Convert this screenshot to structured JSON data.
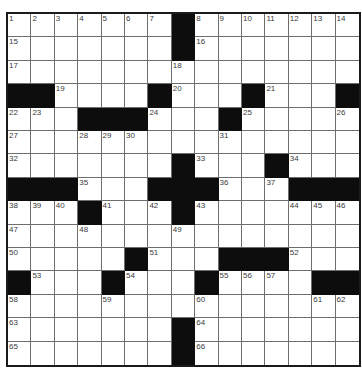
{
  "puzzle": {
    "size": 15,
    "colors": {
      "black_square": "#0d0d0d",
      "grid_line": "#6e6e6e",
      "border": "#1a1a1a"
    },
    "grid": [
      ".......#.......",
      ".......#.......",
      "...............",
      "##....#...#...#",
      "...###...#.....",
      "...............",
      ".......#...#...",
      "###...###...###",
      "...#...#.......",
      "...............",
      ".....#...###...",
      "#...#...#....##",
      "...............",
      ".......#.......",
      ".......#......."
    ],
    "numbers": [
      {
        "r": 0,
        "c": 0,
        "n": "1"
      },
      {
        "r": 0,
        "c": 1,
        "n": "2"
      },
      {
        "r": 0,
        "c": 2,
        "n": "3"
      },
      {
        "r": 0,
        "c": 3,
        "n": "4"
      },
      {
        "r": 0,
        "c": 4,
        "n": "5"
      },
      {
        "r": 0,
        "c": 5,
        "n": "6"
      },
      {
        "r": 0,
        "c": 6,
        "n": "7"
      },
      {
        "r": 0,
        "c": 8,
        "n": "8"
      },
      {
        "r": 0,
        "c": 9,
        "n": "9"
      },
      {
        "r": 0,
        "c": 10,
        "n": "10"
      },
      {
        "r": 0,
        "c": 11,
        "n": "11"
      },
      {
        "r": 0,
        "c": 12,
        "n": "12"
      },
      {
        "r": 0,
        "c": 13,
        "n": "13"
      },
      {
        "r": 0,
        "c": 14,
        "n": "14"
      },
      {
        "r": 1,
        "c": 0,
        "n": "15"
      },
      {
        "r": 1,
        "c": 8,
        "n": "16"
      },
      {
        "r": 2,
        "c": 0,
        "n": "17"
      },
      {
        "r": 2,
        "c": 7,
        "n": "18"
      },
      {
        "r": 3,
        "c": 2,
        "n": "19"
      },
      {
        "r": 3,
        "c": 7,
        "n": "20"
      },
      {
        "r": 3,
        "c": 11,
        "n": "21"
      },
      {
        "r": 4,
        "c": 0,
        "n": "22"
      },
      {
        "r": 4,
        "c": 1,
        "n": "23"
      },
      {
        "r": 4,
        "c": 6,
        "n": "24"
      },
      {
        "r": 4,
        "c": 10,
        "n": "25"
      },
      {
        "r": 4,
        "c": 14,
        "n": "26"
      },
      {
        "r": 5,
        "c": 0,
        "n": "27"
      },
      {
        "r": 5,
        "c": 3,
        "n": "28"
      },
      {
        "r": 5,
        "c": 4,
        "n": "29"
      },
      {
        "r": 5,
        "c": 5,
        "n": "30"
      },
      {
        "r": 5,
        "c": 9,
        "n": "31"
      },
      {
        "r": 6,
        "c": 0,
        "n": "32"
      },
      {
        "r": 6,
        "c": 8,
        "n": "33"
      },
      {
        "r": 6,
        "c": 12,
        "n": "34"
      },
      {
        "r": 7,
        "c": 3,
        "n": "35"
      },
      {
        "r": 7,
        "c": 9,
        "n": "36"
      },
      {
        "r": 7,
        "c": 11,
        "n": "37"
      },
      {
        "r": 8,
        "c": 0,
        "n": "38"
      },
      {
        "r": 8,
        "c": 1,
        "n": "39"
      },
      {
        "r": 8,
        "c": 2,
        "n": "40"
      },
      {
        "r": 8,
        "c": 4,
        "n": "41"
      },
      {
        "r": 8,
        "c": 6,
        "n": "42"
      },
      {
        "r": 8,
        "c": 8,
        "n": "43"
      },
      {
        "r": 8,
        "c": 12,
        "n": "44"
      },
      {
        "r": 8,
        "c": 13,
        "n": "45"
      },
      {
        "r": 8,
        "c": 14,
        "n": "46"
      },
      {
        "r": 9,
        "c": 0,
        "n": "47"
      },
      {
        "r": 9,
        "c": 3,
        "n": "48"
      },
      {
        "r": 9,
        "c": 7,
        "n": "49"
      },
      {
        "r": 10,
        "c": 0,
        "n": "50"
      },
      {
        "r": 10,
        "c": 6,
        "n": "51"
      },
      {
        "r": 10,
        "c": 12,
        "n": "52"
      },
      {
        "r": 11,
        "c": 1,
        "n": "53"
      },
      {
        "r": 11,
        "c": 5,
        "n": "54"
      },
      {
        "r": 11,
        "c": 9,
        "n": "55"
      },
      {
        "r": 11,
        "c": 10,
        "n": "56"
      },
      {
        "r": 11,
        "c": 11,
        "n": "57"
      },
      {
        "r": 12,
        "c": 0,
        "n": "58"
      },
      {
        "r": 12,
        "c": 4,
        "n": "59"
      },
      {
        "r": 12,
        "c": 8,
        "n": "60"
      },
      {
        "r": 12,
        "c": 13,
        "n": "61"
      },
      {
        "r": 12,
        "c": 14,
        "n": "62"
      },
      {
        "r": 13,
        "c": 0,
        "n": "63"
      },
      {
        "r": 13,
        "c": 8,
        "n": "64"
      },
      {
        "r": 14,
        "c": 0,
        "n": "65"
      },
      {
        "r": 14,
        "c": 8,
        "n": "66"
      }
    ]
  }
}
